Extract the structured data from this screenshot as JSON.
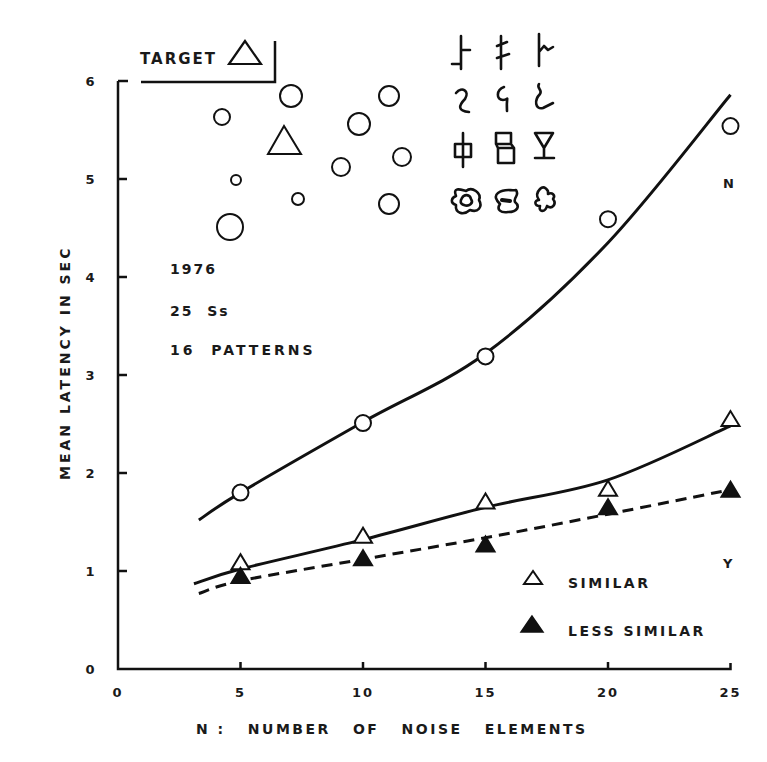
{
  "chart_data": {
    "type": "line",
    "title": "",
    "xlabel": "N :   NUMBER   OF   NOISE   ELEMENTS",
    "ylabel": "MEAN LATENCY IN SEC",
    "xlim": [
      0,
      25
    ],
    "ylim": [
      0,
      6
    ],
    "x_ticks": [
      "0",
      "5",
      "10",
      "15",
      "20",
      "25"
    ],
    "y_ticks": [
      "0",
      "1",
      "2",
      "3",
      "4",
      "5",
      "6"
    ],
    "grid": false,
    "x": [
      5,
      10,
      15,
      20,
      25
    ],
    "series": [
      {
        "name": "N (target absent)",
        "marker": "open-circle",
        "line": "solid",
        "values": [
          1.8,
          2.51,
          3.19,
          4.59,
          5.54
        ],
        "fit": [
          [
            3.3,
            1.52
          ],
          [
            5,
            1.8
          ],
          [
            10,
            2.52
          ],
          [
            15,
            3.22
          ],
          [
            20,
            4.35
          ],
          [
            25,
            5.86
          ]
        ]
      },
      {
        "name": "SIMILAR",
        "marker": "open-triangle",
        "line": "solid",
        "values": [
          1.08,
          1.35,
          1.7,
          1.83,
          2.54
        ],
        "fit": [
          [
            3.1,
            0.87
          ],
          [
            5,
            1.02
          ],
          [
            10,
            1.32
          ],
          [
            15,
            1.65
          ],
          [
            20,
            1.93
          ],
          [
            25,
            2.48
          ]
        ]
      },
      {
        "name": "LESS SIMILAR",
        "marker": "filled-triangle",
        "line": "dashed",
        "values": [
          0.94,
          1.12,
          1.26,
          1.64,
          1.82
        ],
        "fit": [
          [
            3.3,
            0.77
          ],
          [
            5,
            0.9
          ],
          [
            10,
            1.12
          ],
          [
            15,
            1.34
          ],
          [
            20,
            1.58
          ],
          [
            25,
            1.83
          ]
        ]
      }
    ],
    "annotations": {
      "target_label": "TARGET",
      "year": "1976",
      "subjects": "25  Ss",
      "patterns": "16  PATTERNS",
      "n_label": "N",
      "y_label": "Y"
    },
    "legend": [
      {
        "label": "SIMILAR",
        "marker": "open-triangle"
      },
      {
        "label": "LESS SIMILAR",
        "marker": "filled-triangle"
      }
    ],
    "legend_position": "lower-right"
  },
  "stimulus_display": {
    "circles": [
      {
        "cx": 222,
        "cy": 117,
        "r": 8
      },
      {
        "cx": 291,
        "cy": 96,
        "r": 11
      },
      {
        "cx": 389,
        "cy": 96,
        "r": 10
      },
      {
        "cx": 359,
        "cy": 124,
        "r": 11
      },
      {
        "cx": 402,
        "cy": 157,
        "r": 9
      },
      {
        "cx": 341,
        "cy": 167,
        "r": 9
      },
      {
        "cx": 236,
        "cy": 180,
        "r": 5
      },
      {
        "cx": 298,
        "cy": 199,
        "r": 6
      },
      {
        "cx": 389,
        "cy": 204,
        "r": 10
      },
      {
        "cx": 230,
        "cy": 227,
        "r": 13
      }
    ],
    "pattern_rows": 4,
    "pattern_cols": 3
  }
}
